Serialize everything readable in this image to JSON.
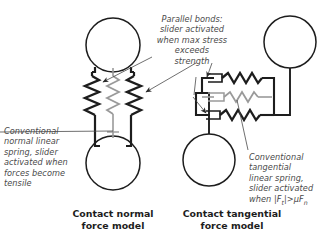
{
  "figure": {
    "title_left": "Contact normal\nforce model",
    "title_right": "Contact tangential\nforce model",
    "background_color": "#ffffff",
    "line_color": "#1d1d1d",
    "accent_gray": "#9a9a9a",
    "text_color": "#4a4a4a"
  },
  "annotations": {
    "parallel_bonds": "Parallel bonds:\nslider activated\nwhen max stress\nexceeds\nstrength",
    "conventional_normal": "Conventional\nnormal linear\nspring, slider\nactivated when\nforces become\ntensile",
    "conventional_tangential": "Conventional\ntangential\nlinear spring,\nslider activated",
    "tangential_condition_prefix": "when ",
    "tangential_condition_formula": "|Ft|>μFn",
    "tangential_condition_parts": {
      "bar_open": "|",
      "f_symbol": "F",
      "t_subscript": "t",
      "bar_close": "|",
      "operator": ">",
      "mu": "μ",
      "f_symbol_2": "F",
      "n_subscript": "n"
    }
  },
  "models": {
    "normal": {
      "name": "Contact normal force model",
      "orientation": "vertical",
      "particles": [
        {
          "id": "upper-particle",
          "cx": 113,
          "cy": 45,
          "r": 27
        },
        {
          "id": "lower-particle",
          "cx": 113,
          "cy": 163,
          "r": 27
        }
      ],
      "branches": [
        {
          "id": "left-bond",
          "type": "parallel-bond",
          "color": "#1d1d1d",
          "element": "spring-with-slider"
        },
        {
          "id": "center-spring",
          "type": "conventional-normal-spring",
          "color": "#9a9a9a",
          "element": "spring-with-slider"
        },
        {
          "id": "right-bond",
          "type": "parallel-bond",
          "color": "#1d1d1d",
          "element": "spring-with-slider"
        }
      ]
    },
    "tangential": {
      "name": "Contact tangential force model",
      "orientation": "horizontal",
      "particles": [
        {
          "id": "upper-particle",
          "cx": 290,
          "cy": 42,
          "r": 26
        },
        {
          "id": "lower-particle",
          "cx": 209,
          "cy": 160,
          "r": 26
        }
      ],
      "branches": [
        {
          "id": "top-bond",
          "type": "parallel-bond",
          "color": "#1d1d1d",
          "element": "slider-and-spring"
        },
        {
          "id": "middle-spring",
          "type": "conventional-tangential-spring",
          "color": "#9a9a9a",
          "element": "slider-and-spring"
        },
        {
          "id": "bottom-bond",
          "type": "parallel-bond",
          "color": "#1d1d1d",
          "element": "slider-and-spring"
        }
      ]
    }
  },
  "leader_lines": [
    {
      "id": "parallel-to-left-spring",
      "target": "normal-left-bond",
      "arrow": true
    },
    {
      "id": "parallel-to-right-spring",
      "target": "normal-right-bond",
      "arrow": true
    },
    {
      "id": "parallel-to-tangential-top",
      "target": "tangential-top-bond",
      "arrow": true
    },
    {
      "id": "normal-to-center-spring",
      "target": "normal-center-spring",
      "arrow": false
    },
    {
      "id": "tangential-to-middle-spring",
      "target": "tangential-middle-spring",
      "arrow": false
    },
    {
      "id": "parallel-to-tangential-bottom",
      "target": "tangential-bottom-bond",
      "arrow": true
    }
  ]
}
